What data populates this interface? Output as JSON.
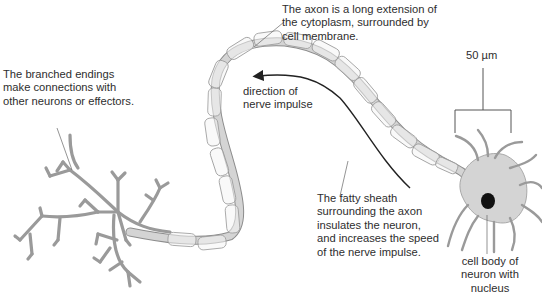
{
  "diagram": {
    "colors": {
      "membrane_fill": "#d4d4d4",
      "sheath_fill": "#f4f4f4",
      "outline": "#8c8c8c",
      "nucleus": "#111111",
      "arrow": "#222222"
    },
    "labels": {
      "branched_endings": "The branched endings\nmake connections with\nother neurons or effectors.",
      "axon": "The axon is a long extension of\nthe cytoplasm, surrounded by\ncell membrane.",
      "direction": "direction of\nnerve impulse",
      "fatty_sheath": "The fatty sheath\nsurrounding the axon\ninsulates the neuron,\nand increases the speed\nof the nerve impulse.",
      "scale_bar": "50 µm",
      "cell_body": "cell body of\nneuron with\nnucleus"
    }
  }
}
